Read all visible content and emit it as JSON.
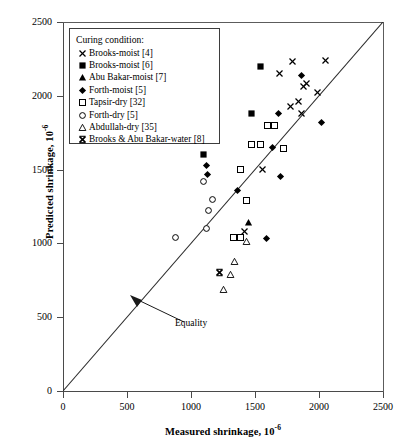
{
  "chart_data": {
    "type": "scatter",
    "title": "",
    "xlabel": "Measured shrinkage, 10-6",
    "xlabel_main": "Measured shrinkage, 10",
    "xlabel_exp": "-6",
    "ylabel_main": "Predicted shrinkage, 10",
    "ylabel_exp": "-6",
    "xlim": [
      0,
      2500
    ],
    "ylim": [
      0,
      2500
    ],
    "xticks": [
      0,
      500,
      1000,
      1500,
      2000,
      2500
    ],
    "yticks": [
      0,
      500,
      1000,
      1500,
      2000,
      2500
    ],
    "grid": false,
    "legend_position": "top-left",
    "legend_title": "Curing condition:",
    "annotations": [
      {
        "text": "Equality",
        "x": 1180,
        "y": 480,
        "note": "arrow pointing to 1:1 equality line"
      }
    ],
    "reference_line": {
      "name": "Equality",
      "type": "1:1",
      "from": [
        0,
        0
      ],
      "to": [
        2500,
        2500
      ]
    },
    "series": [
      {
        "name": "Brooks-moist [4]",
        "marker": "x-thin",
        "points": [
          [
            1560,
            1500
          ],
          [
            1690,
            2150
          ],
          [
            1790,
            2230
          ],
          [
            1780,
            1930
          ],
          [
            1840,
            1960
          ],
          [
            1860,
            1880
          ],
          [
            1880,
            2060
          ],
          [
            1900,
            2080
          ],
          [
            1990,
            2020
          ],
          [
            2050,
            2240
          ],
          [
            1420,
            1080
          ]
        ]
      },
      {
        "name": "Brooks-moist [6]",
        "marker": "filled-square",
        "points": [
          [
            1120,
            2200
          ],
          [
            1100,
            1600
          ],
          [
            1540,
            2200
          ],
          [
            1470,
            1880
          ]
        ]
      },
      {
        "name": "Abu Bakar-moist [7]",
        "marker": "filled-triangle",
        "points": [
          [
            1450,
            1140
          ]
        ]
      },
      {
        "name": "Forth-moist [5]",
        "marker": "filled-diamond",
        "points": [
          [
            1120,
            1530
          ],
          [
            1130,
            1470
          ],
          [
            1360,
            1360
          ],
          [
            1640,
            1650
          ],
          [
            1680,
            1880
          ],
          [
            1700,
            1450
          ],
          [
            1860,
            2140
          ],
          [
            2020,
            1820
          ],
          [
            1590,
            1030
          ]
        ]
      },
      {
        "name": "Tapsir-dry [32]",
        "marker": "open-square",
        "points": [
          [
            1470,
            1670
          ],
          [
            1540,
            1670
          ],
          [
            1390,
            1500
          ],
          [
            1430,
            1290
          ],
          [
            1600,
            1800
          ],
          [
            1650,
            1800
          ],
          [
            1720,
            1640
          ],
          [
            1330,
            1040
          ],
          [
            1390,
            1040
          ]
        ]
      },
      {
        "name": "Forth-dry [5]",
        "marker": "open-circle",
        "points": [
          [
            880,
            1040
          ],
          [
            1120,
            1100
          ],
          [
            1140,
            1220
          ],
          [
            1170,
            1300
          ],
          [
            1100,
            1420
          ]
        ]
      },
      {
        "name": "Abdullah-dry [35]",
        "marker": "open-triangle",
        "points": [
          [
            1340,
            880
          ],
          [
            1310,
            790
          ],
          [
            1250,
            690
          ],
          [
            1430,
            1010
          ]
        ]
      },
      {
        "name": "Brooks & Abu Bakar-water [8]",
        "marker": "x-bold",
        "points": [
          [
            1220,
            800
          ]
        ]
      }
    ]
  },
  "axes": {
    "x_tick_labels": [
      "0",
      "500",
      "1000",
      "1500",
      "2000",
      "2500"
    ],
    "y_tick_labels": [
      "0",
      "500",
      "1000",
      "1500",
      "2000",
      "2500"
    ]
  },
  "legend": {
    "title": "Curing condition:",
    "items": [
      {
        "label": "Brooks-moist [4]",
        "marker": "x-thin"
      },
      {
        "label": "Brooks-moist [6]",
        "marker": "filled-square"
      },
      {
        "label": "Abu Bakar-moist [7]",
        "marker": "filled-triangle"
      },
      {
        "label": "Forth-moist [5]",
        "marker": "filled-diamond"
      },
      {
        "label": "Tapsir-dry [32]",
        "marker": "open-square"
      },
      {
        "label": "Forth-dry [5]",
        "marker": "open-circle"
      },
      {
        "label": "Abdullah-dry [35]",
        "marker": "open-triangle"
      },
      {
        "label": "Brooks & Abu Bakar-water [8]",
        "marker": "x-bold"
      }
    ]
  },
  "colors": {
    "ink": "#000000",
    "axis": "#4a4a4a",
    "background": "#ffffff"
  }
}
